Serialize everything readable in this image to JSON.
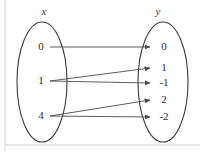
{
  "diagram": {
    "type": "mapping-diagram",
    "title": "",
    "domain_set": {
      "label": "x",
      "label_x": 44,
      "label_y": 12,
      "oval": {
        "cx": 42,
        "cy": 82,
        "rx": 25,
        "ry": 60
      },
      "elements": [
        {
          "value": "0",
          "x": 41,
          "y": 47
        },
        {
          "value": "1",
          "x": 41,
          "y": 81
        },
        {
          "value": "4",
          "x": 41,
          "y": 116
        }
      ]
    },
    "codomain_set": {
      "label": "y",
      "label_x": 158,
      "label_y": 12,
      "oval": {
        "cx": 163,
        "cy": 82,
        "rx": 25,
        "ry": 60
      },
      "elements": [
        {
          "value": "0",
          "x": 164,
          "y": 47
        },
        {
          "value": "1",
          "x": 164,
          "y": 68
        },
        {
          "value": "-1",
          "x": 164,
          "y": 83
        },
        {
          "value": "2",
          "x": 164,
          "y": 100
        },
        {
          "value": "-2",
          "x": 164,
          "y": 117
        }
      ]
    },
    "mappings": [
      {
        "from": "0",
        "to": "0",
        "x1": 50,
        "y1": 47,
        "x2": 150,
        "y2": 47
      },
      {
        "from": "1",
        "to": "1",
        "x1": 50,
        "y1": 81,
        "x2": 150,
        "y2": 68
      },
      {
        "from": "1",
        "to": "-1",
        "x1": 50,
        "y1": 81,
        "x2": 150,
        "y2": 83
      },
      {
        "from": "4",
        "to": "2",
        "x1": 50,
        "y1": 116,
        "x2": 150,
        "y2": 100
      },
      {
        "from": "4",
        "to": "-2",
        "x1": 50,
        "y1": 116,
        "x2": 150,
        "y2": 117
      }
    ],
    "colors": {
      "oval_stroke": "#3c3c3c",
      "arrow_stroke": "#4a4a4a",
      "text": "#2b2b2b",
      "label_text": "#3a3a3a",
      "frame": "#d2d2d2",
      "background": "#ffffff"
    },
    "frame": {
      "left_rule_x": 5,
      "bottom_rule_y": 145
    }
  }
}
